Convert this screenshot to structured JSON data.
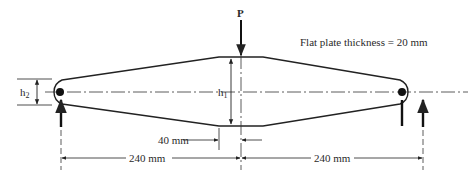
{
  "diagram": {
    "title_note": "Flat plate thickness = 20 mm",
    "load_label": "P",
    "h1_label": "h",
    "h1_sub": "1",
    "h2_label": "h",
    "h2_sub": "2",
    "dim_center_gap": "40 mm",
    "dim_left_span": "240 mm",
    "dim_right_span": "240 mm",
    "colors": {
      "line": "#222222",
      "background": "#ffffff"
    }
  }
}
